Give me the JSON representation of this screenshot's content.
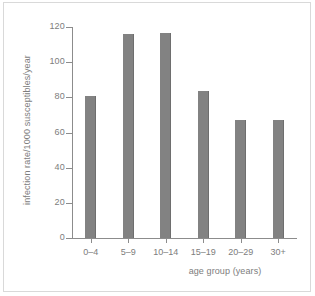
{
  "chart_data": {
    "type": "bar",
    "title": "",
    "subtitle": "",
    "categories": [
      "0–4",
      "5–9",
      "10–14",
      "15–19",
      "20–29",
      "30+"
    ],
    "values": [
      81,
      116,
      116.5,
      83.5,
      67,
      67
    ],
    "xlabel": "age group (years)",
    "ylabel": "infection rate/1000 susceptibles/year",
    "ylim": [
      0,
      120
    ],
    "yticks": [
      0,
      20,
      40,
      60,
      80,
      100,
      120
    ],
    "ytick_labels": [
      "0",
      "20",
      "40",
      "60",
      "80",
      "100",
      "120"
    ],
    "grid": false,
    "legend": false,
    "legend_position": "none",
    "bar_color": "#828282",
    "axis_color": "#8c8c8c",
    "text_color": "#7d7d7d",
    "background_color": "#ffffff",
    "frame_color": "#d9d9d9"
  }
}
